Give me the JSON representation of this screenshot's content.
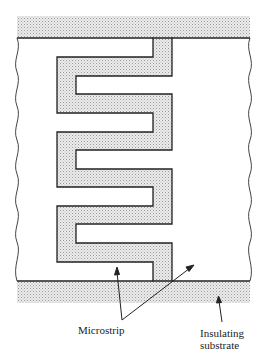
{
  "figure": {
    "type": "meander-line microstrip diagram",
    "labels": {
      "microstrip": "Microstrip",
      "substrate_line1": "Insulating",
      "substrate_line2": "substrate"
    },
    "colors": {
      "stipple": "#d8d8d8",
      "line": "#222222",
      "background": "#ffffff"
    }
  }
}
